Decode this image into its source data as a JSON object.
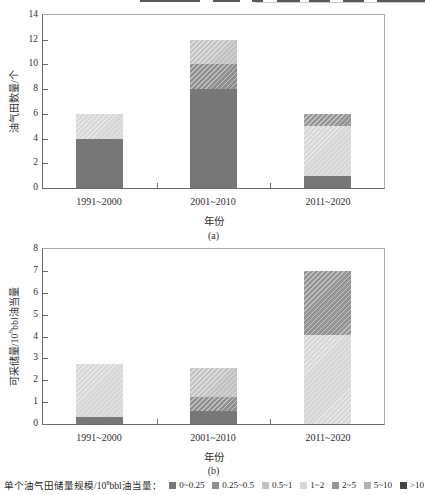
{
  "figure": {
    "background": "#ffffff",
    "axis_color": "#6a6a6a",
    "frame_color": "#ababab",
    "text_color": "#2e2e2e"
  },
  "legend": {
    "position": "bottom",
    "title": {
      "pre": "单个油气田储量规模/10",
      "sup": "8",
      "post": "bbl油当量："
    },
    "items": [
      {
        "label": "0~0.25",
        "color": "#777777",
        "hatch": false
      },
      {
        "label": "0.25~0.5",
        "color": "#8f8f8f",
        "hatch": true
      },
      {
        "label": "0.5~1",
        "color": "#c3c3c3",
        "hatch": true
      },
      {
        "label": "1~2",
        "color": "#d7d7d7",
        "hatch": true
      },
      {
        "label": "2~5",
        "color": "#949494",
        "hatch": true
      },
      {
        "label": "5~10",
        "color": "#b2b2b2",
        "hatch": true
      },
      {
        "label": ">10",
        "color": "#454545",
        "hatch": false
      }
    ]
  },
  "chart_data": [
    {
      "id": "a",
      "type": "bar",
      "stacked": true,
      "sublabel": "(a)",
      "xlabel": "年份",
      "ylabel": {
        "pre": "油气田数量/个",
        "sup": "",
        "post": ""
      },
      "ylim": [
        0,
        14
      ],
      "yticks": [
        0,
        2,
        4,
        6,
        8,
        10,
        12,
        14
      ],
      "grid": false,
      "categories": [
        "1991~2000",
        "2001~2010",
        "2011~2020"
      ],
      "series": [
        {
          "name": "0~0.25",
          "values": [
            4,
            8,
            1
          ]
        },
        {
          "name": "0.25~0.5",
          "values": [
            0,
            2,
            0
          ]
        },
        {
          "name": "0.5~1",
          "values": [
            0,
            2,
            0
          ]
        },
        {
          "name": "1~2",
          "values": [
            2,
            0,
            4
          ]
        },
        {
          "name": "2~5",
          "values": [
            0,
            0,
            1
          ]
        }
      ]
    },
    {
      "id": "b",
      "type": "bar",
      "stacked": true,
      "sublabel": "(b)",
      "xlabel": "年份",
      "ylabel": {
        "pre": "可采储量/10",
        "sup": "8",
        "post": "bbl油当量"
      },
      "ylim": [
        0,
        8
      ],
      "yticks": [
        0,
        1,
        2,
        3,
        4,
        5,
        6,
        7,
        8
      ],
      "grid": false,
      "categories": [
        "1991~2000",
        "2001~2010",
        "2011~2020"
      ],
      "series": [
        {
          "name": "0~0.25",
          "values": [
            0.3,
            0.6,
            0
          ]
        },
        {
          "name": "0.25~0.5",
          "values": [
            0,
            0.65,
            0
          ]
        },
        {
          "name": "0.5~1",
          "values": [
            0,
            1.3,
            0
          ]
        },
        {
          "name": "1~2",
          "values": [
            2.45,
            0,
            4.05
          ]
        },
        {
          "name": "2~5",
          "values": [
            0,
            0,
            2.95
          ]
        }
      ]
    }
  ]
}
